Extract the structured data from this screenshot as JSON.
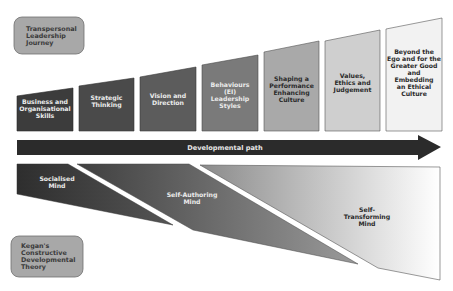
{
  "title_boxes": {
    "top": {
      "lines": [
        "Transpersonal",
        "Leadership",
        "Journey"
      ],
      "fill": "#a8a8a8"
    },
    "bottom": {
      "lines": [
        "Kegan's",
        "Constructive",
        "Developmental",
        "Theory"
      ],
      "fill": "#a8a8a8"
    }
  },
  "columns": [
    {
      "lines": [
        "Business and",
        "Organisational",
        "Skills"
      ],
      "fill": "#3c3c3c",
      "text_color": "light"
    },
    {
      "lines": [
        "Strategic",
        "Thinking"
      ],
      "fill": "#4a4a4a",
      "text_color": "light"
    },
    {
      "lines": [
        "Vision and",
        "Direction"
      ],
      "fill": "#5c5c5c",
      "text_color": "light"
    },
    {
      "lines": [
        "Behaviours",
        "(EI)",
        "Leadership",
        "Styles"
      ],
      "fill": "#7a7a7a",
      "text_color": "light"
    },
    {
      "lines": [
        "Shaping a",
        "Performance",
        "Enhancing",
        "Culture"
      ],
      "fill": "#a9a9a9",
      "text_color": "dark"
    },
    {
      "lines": [
        "Values,",
        "Ethics and",
        "Judgement"
      ],
      "fill": "#cfcfcf",
      "text_color": "dark"
    },
    {
      "lines": [
        "Beyond the",
        "Ego and for the",
        "Greater Good",
        "and",
        "Embedding",
        "an Ethical",
        "Culture"
      ],
      "fill": "#f2f2f2",
      "text_color": "dark"
    }
  ],
  "arrow": {
    "label": "Developmental path",
    "fill": "#2b2b2b"
  },
  "kegan_stages": [
    {
      "lines": [
        "Socialised",
        "Mind"
      ]
    },
    {
      "lines": [
        "Self-Authoring",
        "Mind"
      ]
    },
    {
      "lines": [
        "Self-",
        "Transforming",
        "Mind"
      ]
    }
  ]
}
